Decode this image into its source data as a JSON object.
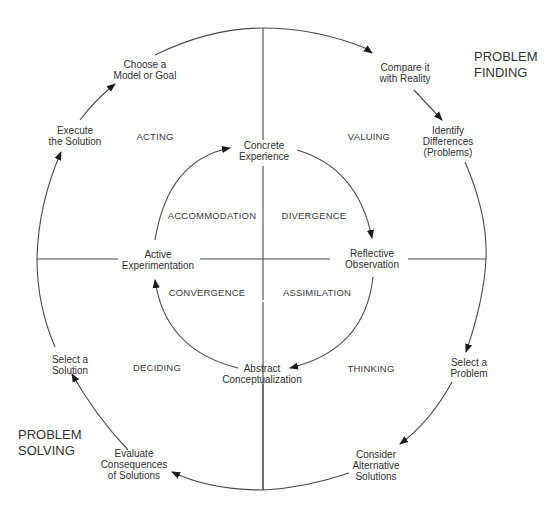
{
  "diagram": {
    "type": "cycle",
    "title_labels": {
      "problem_finding": [
        "PROBLEM",
        "FINDING"
      ],
      "problem_solving": [
        "PROBLEM",
        "SOLVING"
      ]
    },
    "outer_cycle_steps": [
      {
        "lines": [
          "Choose a",
          "Model or Goal"
        ]
      },
      {
        "lines": [
          "Compare it",
          "with Reality"
        ]
      },
      {
        "lines": [
          "Identify",
          "Differences",
          "(Problems)"
        ]
      },
      {
        "lines": [
          "Select a",
          "Problem"
        ]
      },
      {
        "lines": [
          "Consider",
          "Alternative",
          "Solutions"
        ]
      },
      {
        "lines": [
          "Evaluate",
          "Consequences",
          "of Solutions"
        ]
      },
      {
        "lines": [
          "Select a",
          "Solution"
        ]
      },
      {
        "lines": [
          "Execute",
          "the Solution"
        ]
      }
    ],
    "outer_quadrants": {
      "top_left": "ACTING",
      "top_right": "VALUING",
      "bottom_right": "THINKING",
      "bottom_left": "DECIDING"
    },
    "inner_cycle_steps": [
      {
        "lines": [
          "Concrete",
          "Experience"
        ]
      },
      {
        "lines": [
          "Reflective",
          "Observation"
        ]
      },
      {
        "lines": [
          "Abstract",
          "Conceptualization"
        ]
      },
      {
        "lines": [
          "Active",
          "Experimentation"
        ]
      }
    ],
    "inner_quadrants": {
      "top_left": "ACCOMMODATION",
      "top_right": "DIVERGENCE",
      "bottom_right": "ASSIMILATION",
      "bottom_left": "CONVERGENCE"
    },
    "colors": {
      "line": "#4a4a4a",
      "text": "#2f2f2f",
      "background": "#ffffff"
    }
  }
}
